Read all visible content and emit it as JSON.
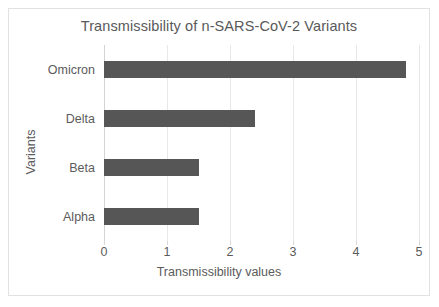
{
  "chart_data": {
    "type": "bar",
    "orientation": "horizontal",
    "title": "Transmissibility of n-SARS-CoV-2 Variants",
    "xlabel": "Transmissibility values",
    "ylabel": "Variants",
    "categories": [
      "Alpha",
      "Beta",
      "Delta",
      "Omicron"
    ],
    "values": [
      1.5,
      1.5,
      2.4,
      4.8
    ],
    "xlim": [
      0,
      5
    ],
    "xticks": [
      "0",
      "1",
      "2",
      "3",
      "4",
      "5"
    ],
    "xtick_values": [
      0,
      1,
      2,
      3,
      4,
      5
    ],
    "grid": true,
    "legend": null,
    "bar_color": "#565656",
    "gridline_color": "#e8e8e8",
    "text_color": "#5b5b5b",
    "background": "#ffffff",
    "border_color": "#e2e2e2",
    "bars": [
      {
        "category": "Omicron",
        "value": 4.8
      },
      {
        "category": "Delta",
        "value": 2.4
      },
      {
        "category": "Beta",
        "value": 1.5
      },
      {
        "category": "Alpha",
        "value": 1.5
      }
    ]
  }
}
